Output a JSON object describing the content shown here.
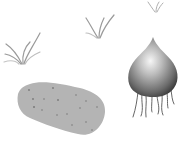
{
  "scene": {
    "description": "Illustration of a potato tuber and an onion-like bulb with roots, with grass tufts in the background",
    "background": "#ffffff",
    "objects": [
      {
        "name": "grass-tuft-left",
        "color": "#9a9a9a"
      },
      {
        "name": "grass-tuft-middle",
        "color": "#9a9a9a"
      },
      {
        "name": "grass-tuft-right",
        "color": "#b0b0b0"
      },
      {
        "name": "potato",
        "color": "#b4b4b4",
        "spot_color": "#7a7a7a"
      },
      {
        "name": "bulb",
        "highlight": "#f4f4f4",
        "shadow": "#3c3c3c",
        "root_color": "#555555"
      }
    ]
  }
}
